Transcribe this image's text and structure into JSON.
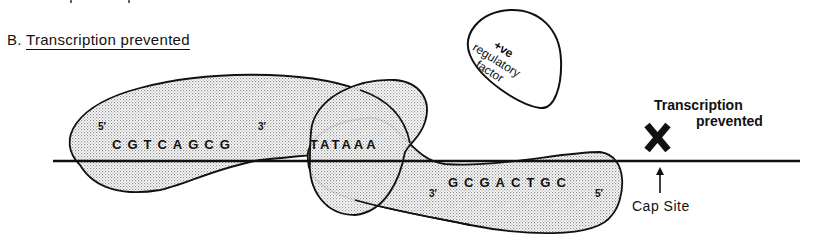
{
  "panel": {
    "label": "B.",
    "title": "Transcription prevented"
  },
  "regulatory_factor": {
    "line1": "+ve",
    "line2": "regulatory",
    "line3": "factor"
  },
  "upper_strand": {
    "five_prime": "5′",
    "sequence": "CGTCAGCG",
    "three_prime": "3′"
  },
  "tata_box": {
    "sequence": "TATAAA"
  },
  "lower_strand": {
    "three_prime": "3′",
    "sequence": "GCGACTGC",
    "five_prime": "5′"
  },
  "outcome": {
    "line1": "Transcription",
    "line2": "prevented",
    "blocked_icon": "x-mark-icon"
  },
  "cap_site": {
    "label": "Cap Site",
    "icon": "up-arrow-icon"
  },
  "colors": {
    "ink": "#111111",
    "stipple": "#9a9a9a",
    "background": "#ffffff"
  }
}
